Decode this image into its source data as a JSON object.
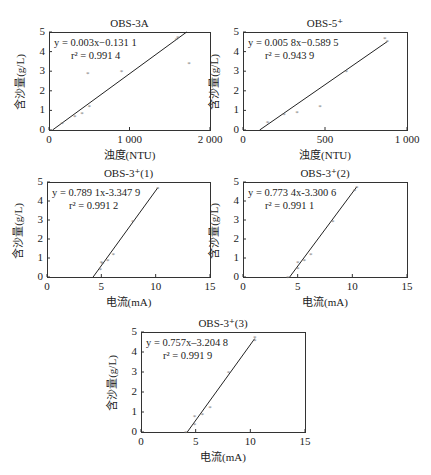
{
  "figure": {
    "ylabel": "含沙量(g/L)"
  },
  "chart_data": [
    {
      "id": "obs3a",
      "type": "scatter",
      "title": "OBS-3A",
      "xlabel": "浊度(NTU)",
      "ylabel": "含沙量(g/L)",
      "xlim": [
        0,
        2000
      ],
      "ylim": [
        0,
        5
      ],
      "xticks": [
        0,
        1000,
        2000
      ],
      "xtick_labels": [
        "0",
        "1 000",
        "2 000"
      ],
      "yticks": [
        0,
        1,
        2,
        3,
        4,
        5
      ],
      "grid": false,
      "equation": "y = 0.003x−0.131 1",
      "r2": "r² = 0.991 4",
      "fit": {
        "slope": 0.003,
        "intercept": -0.1311
      },
      "x": [
        160,
        320,
        410,
        500,
        480,
        900,
        1580,
        1600,
        1740
      ],
      "y": [
        0.35,
        0.7,
        0.87,
        1.25,
        2.9,
        3.0,
        4.65,
        4.75,
        3.4
      ]
    },
    {
      "id": "obs5",
      "type": "scatter",
      "title": "OBS-5⁺",
      "xlabel": "浊度(NTU)",
      "ylabel": "含沙量(g/L)",
      "xlim": [
        0,
        1000
      ],
      "ylim": [
        0,
        5
      ],
      "xticks": [
        0,
        500,
        1000
      ],
      "xtick_labels": [
        "0",
        "500",
        "1 000"
      ],
      "yticks": [
        0,
        1,
        2,
        3,
        4,
        5
      ],
      "grid": false,
      "equation": "y = 0.005 8x−0.589 5",
      "r2": "r² = 0.943 9",
      "fit": {
        "slope": 0.0058,
        "intercept": -0.5895
      },
      "x": [
        150,
        250,
        330,
        470,
        630,
        865,
        880
      ],
      "y": [
        0.4,
        0.8,
        0.9,
        1.25,
        3.0,
        4.7,
        4.55
      ]
    },
    {
      "id": "obs3p1",
      "type": "scatter",
      "title": "OBS-3⁺(1)",
      "xlabel": "电流(mA)",
      "ylabel": "含沙量(g/L)",
      "xlim": [
        0,
        15
      ],
      "ylim": [
        0,
        5
      ],
      "xticks": [
        0,
        5,
        10,
        15
      ],
      "xtick_labels": [
        "0",
        "5",
        "10",
        "15"
      ],
      "yticks": [
        0,
        1,
        2,
        3,
        4,
        5
      ],
      "grid": false,
      "equation": "y = 0.789 1x-3.347 9",
      "r2": "r² = 0.991 2",
      "fit": {
        "slope": 0.7891,
        "intercept": -3.3479
      },
      "x": [
        4.9,
        5.0,
        5.1,
        5.6,
        6.1,
        7.9,
        10.2
      ],
      "y": [
        0.4,
        0.8,
        0.75,
        0.9,
        1.2,
        2.95,
        4.7
      ]
    },
    {
      "id": "obs3p2",
      "type": "scatter",
      "title": "OBS-3⁺(2)",
      "xlabel": "电流(mA)",
      "ylabel": "含沙量(g/L)",
      "xlim": [
        0,
        15
      ],
      "ylim": [
        0,
        5
      ],
      "xticks": [
        0,
        5,
        10,
        15
      ],
      "xtick_labels": [
        "0",
        "5",
        "10",
        "15"
      ],
      "yticks": [
        0,
        1,
        2,
        3,
        4,
        5
      ],
      "grid": false,
      "equation": "y = 0.773 4x-3.300 6",
      "r2": "r² = 0.991 1",
      "fit": {
        "slope": 0.7734,
        "intercept": -3.3006
      },
      "x": [
        4.1,
        5.0,
        5.0,
        5.6,
        6.2,
        8.2,
        10.2,
        10.4
      ],
      "y": [
        0.0,
        0.45,
        0.8,
        0.9,
        1.2,
        2.95,
        4.6,
        4.75
      ]
    },
    {
      "id": "obs3p3",
      "type": "scatter",
      "title": "OBS-3⁺(3)",
      "xlabel": "电流(mA)",
      "ylabel": "含沙量(g/L)",
      "xlim": [
        0,
        15
      ],
      "ylim": [
        0,
        5
      ],
      "xticks": [
        0,
        5,
        10,
        15
      ],
      "xtick_labels": [
        "0",
        "5",
        "10",
        "15"
      ],
      "yticks": [
        0,
        1,
        2,
        3,
        4,
        5
      ],
      "grid": false,
      "equation": "y = 0.757x–3.204 8",
      "r2": "r² = 0.991 9",
      "fit": {
        "slope": 0.757,
        "intercept": -3.2048
      },
      "x": [
        4.1,
        4.9,
        4.9,
        5.6,
        6.3,
        8.0,
        10.4,
        10.4
      ],
      "y": [
        0.0,
        0.4,
        0.8,
        0.9,
        1.25,
        3.0,
        4.6,
        4.75
      ]
    }
  ]
}
